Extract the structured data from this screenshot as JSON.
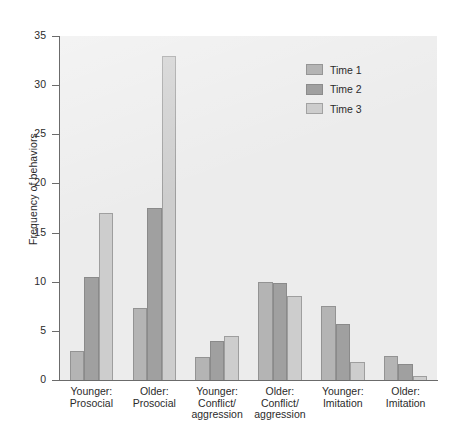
{
  "chart_data": {
    "type": "bar",
    "title": "",
    "xlabel": "",
    "ylabel": "Frequency of behaviors",
    "ylim": [
      0,
      35
    ],
    "yticks": [
      0,
      5,
      10,
      15,
      20,
      25,
      30,
      35
    ],
    "grid": false,
    "legend_position": "top-right",
    "categories": [
      "Younger:\nProsocial",
      "Older:\nProsocial",
      "Younger:\nConflict/\naggression",
      "Older:\nConflict/\naggression",
      "Younger:\nImitation",
      "Older:\nImitation"
    ],
    "series": [
      {
        "name": "Time 1",
        "color": "#b4b4b4",
        "values": [
          3.0,
          7.3,
          2.3,
          10.0,
          7.5,
          2.4
        ]
      },
      {
        "name": "Time 2",
        "color": "#a0a0a0",
        "values": [
          10.5,
          17.5,
          4.0,
          9.9,
          5.7,
          1.6
        ]
      },
      {
        "name": "Time 3",
        "color": "#cdcdcd",
        "values": [
          17.0,
          33.0,
          4.5,
          8.5,
          1.8,
          0.4
        ]
      }
    ]
  },
  "legend": {
    "items": [
      {
        "label": "Time 1",
        "color": "#b4b4b4"
      },
      {
        "label": "Time 2",
        "color": "#a0a0a0"
      },
      {
        "label": "Time 3",
        "color": "#cdcdcd"
      }
    ]
  },
  "axes": {
    "y_title": "Frequency of behaviors",
    "y_tick_labels": [
      "0",
      "5",
      "10",
      "15",
      "20",
      "25",
      "30",
      "35"
    ]
  }
}
